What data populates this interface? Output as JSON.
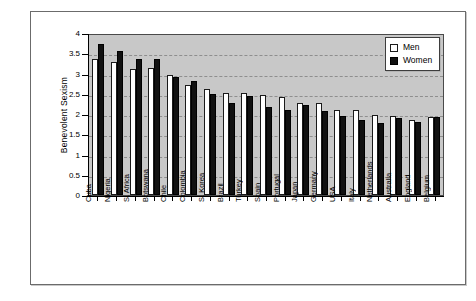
{
  "chart_data": {
    "type": "bar",
    "title": "",
    "xlabel": "",
    "ylabel": "Benevolent Sexism",
    "ylim": [
      0,
      4
    ],
    "ytick_step": 0.5,
    "yticks": [
      "0",
      "0.5",
      "1",
      "1.5",
      "2",
      "2.5",
      "3",
      "3.5",
      "4"
    ],
    "grid": true,
    "grid_style": "dashed-horizontal",
    "legend_position": "top-right",
    "plot_background": "#c8c8c8",
    "categories": [
      "Cuba",
      "Nigeria",
      "S. Africa",
      "Botswana",
      "Chile",
      "Colombia",
      "S. Korea",
      "Brazil",
      "Turkey",
      "Spain",
      "Portugal",
      "Japan",
      "Germany",
      "USA",
      "Italy",
      "Netherlands",
      "Australia",
      "England",
      "Belgium"
    ],
    "series": [
      {
        "name": "Men",
        "color": "#ffffff",
        "values": [
          3.39,
          3.32,
          3.16,
          3.17,
          2.99,
          2.76,
          2.65,
          2.56,
          2.56,
          2.5,
          2.46,
          2.3,
          2.3,
          2.13,
          2.13,
          2.0,
          1.97,
          1.88,
          1.96
        ]
      },
      {
        "name": "Women",
        "color": "#111111",
        "values": [
          3.77,
          3.6,
          3.41,
          3.41,
          2.96,
          2.84,
          2.52,
          2.29,
          2.48,
          2.21,
          2.13,
          2.25,
          2.1,
          1.98,
          1.88,
          1.79,
          1.92,
          1.83,
          1.96
        ]
      }
    ]
  },
  "legend": {
    "items": [
      {
        "label": "Men",
        "swatch": "men"
      },
      {
        "label": "Women",
        "swatch": "women"
      }
    ]
  }
}
